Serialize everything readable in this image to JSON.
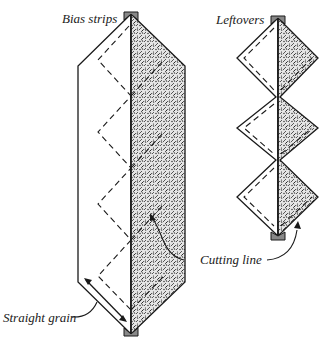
{
  "diagram": {
    "labels": {
      "bias_strips": "Bias strips",
      "leftovers": "Leftovers",
      "cutting_line": "Cutting line",
      "straight_grain": "Straight grain"
    },
    "colors": {
      "ink": "#1a1a1a",
      "fabric_fill": "#d9d9d9",
      "background": "#ffffff"
    }
  }
}
